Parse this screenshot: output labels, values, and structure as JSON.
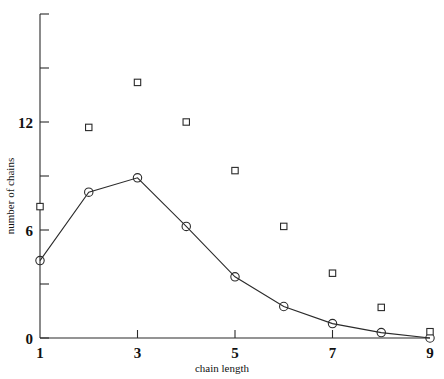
{
  "chart_data": {
    "type": "scatter",
    "title": "",
    "xlabel": "chain length",
    "ylabel": "number of chains",
    "x": [
      1,
      2,
      3,
      4,
      5,
      6,
      7,
      8,
      9
    ],
    "series": [
      {
        "name": "circles",
        "marker": "circle",
        "line": true,
        "values": [
          4.3,
          8.1,
          8.9,
          6.2,
          3.4,
          1.75,
          0.8,
          0.3,
          0.0
        ]
      },
      {
        "name": "squares",
        "marker": "square",
        "line": false,
        "values": [
          7.3,
          11.7,
          14.2,
          12.0,
          9.3,
          6.2,
          3.6,
          1.7,
          0.35
        ]
      }
    ],
    "xlim": [
      1,
      9
    ],
    "ylim": [
      0,
      18
    ],
    "xticks": [
      1,
      3,
      5,
      7,
      9
    ],
    "xtick_labels": [
      "1",
      "3",
      "5",
      "7",
      "9"
    ],
    "xticks_minor": [
      2,
      4,
      6,
      8
    ],
    "yticks": [
      0,
      6,
      12
    ],
    "ytick_labels": [
      "0",
      "6",
      "12"
    ],
    "yticks_minor": [
      3,
      9,
      15,
      18
    ],
    "grid": false,
    "legend": "none"
  },
  "axes": {
    "x_title": "chain length",
    "y_title": "number of chains"
  },
  "tick_labels": {
    "x": [
      "1",
      "3",
      "5",
      "7",
      "9"
    ],
    "y": [
      "0",
      "6",
      "12"
    ]
  },
  "colors": {
    "ink": "#2b2b2b",
    "background": "#ffffff"
  }
}
